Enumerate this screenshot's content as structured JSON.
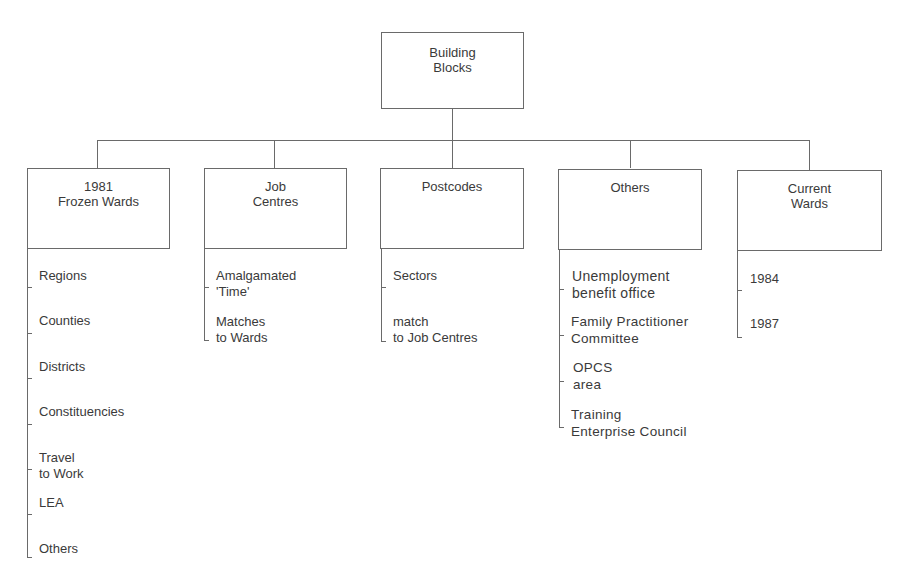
{
  "diagram": {
    "root": {
      "label": "Building\nBlocks",
      "line1": "Building",
      "line2": "Blocks"
    },
    "children": [
      {
        "line1": "1981",
        "line2": "Frozen Wards",
        "items": [
          {
            "text": "Regions"
          },
          {
            "text": "Counties"
          },
          {
            "text": "Districts"
          },
          {
            "text": "Constituencies"
          },
          {
            "line1": "Travel",
            "line2": "to Work"
          },
          {
            "text": "LEA"
          },
          {
            "text": "Others"
          }
        ]
      },
      {
        "line1": "Job",
        "line2": "Centres",
        "items": [
          {
            "line1": "Amalgamated",
            "line2": "'Time'"
          },
          {
            "line1": "Matches",
            "line2": "to Wards"
          }
        ]
      },
      {
        "line1": "Postcodes",
        "line2": "",
        "items": [
          {
            "text": "Sectors"
          },
          {
            "line1": "match",
            "line2": "to Job Centres"
          }
        ]
      },
      {
        "line1": "Others",
        "line2": "",
        "items": [
          {
            "line1": "Unemployment",
            "line2": "benefit office"
          },
          {
            "line1": "Family Practitioner",
            "line2": "Committee"
          },
          {
            "line1": "OPCS",
            "line2": "area"
          },
          {
            "line1": "Training",
            "line2": "Enterprise Council"
          }
        ]
      },
      {
        "line1": "Current",
        "line2": "Wards",
        "items": [
          {
            "text": "1984"
          },
          {
            "text": "1987"
          }
        ]
      }
    ]
  },
  "colors": {
    "line": "#6a6a6a",
    "text": "#3a3a3a",
    "background": "#ffffff"
  }
}
